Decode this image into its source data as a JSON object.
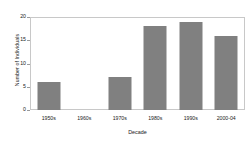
{
  "chart_data": {
    "type": "bar",
    "title": "",
    "subtitle": "",
    "xlabel": "Decade",
    "ylabel": "Number of Individuals",
    "categories": [
      "1950s",
      "1960s",
      "1970s",
      "1980s",
      "1990s",
      "2000-04"
    ],
    "values": [
      6,
      0,
      7,
      18,
      19,
      16
    ],
    "ylim": [
      0,
      20
    ],
    "yticks": [
      0,
      5,
      10,
      15,
      20
    ],
    "ytick_labels": [
      "0",
      "5",
      "10",
      "15",
      "20"
    ],
    "grid": false,
    "legend": null,
    "legend_position": "none",
    "bar_color": "#808080",
    "frame_color": "#c8c8c8",
    "text_color": "#1a1a1a",
    "background_color": "#ffffff",
    "annotations": []
  }
}
